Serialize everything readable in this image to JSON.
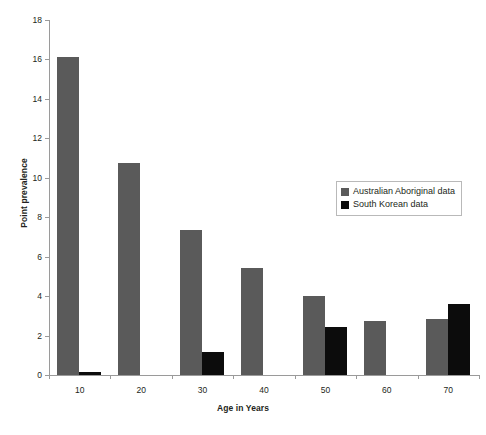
{
  "chart_data": {
    "type": "bar",
    "title": "",
    "xlabel": "Age in Years",
    "ylabel": "Point prevalence",
    "categories": [
      "10",
      "20",
      "30",
      "40",
      "50",
      "60",
      "70"
    ],
    "series": [
      {
        "name": "Australian Aboriginal data",
        "color": "#5a5a5a",
        "values": [
          16.1,
          10.75,
          7.35,
          5.45,
          4.0,
          2.75,
          2.85
        ]
      },
      {
        "name": "South Korean data",
        "color": "#0c0c0c",
        "values": [
          0.15,
          0,
          1.15,
          0,
          2.45,
          0,
          3.6
        ]
      }
    ],
    "ylim": [
      0,
      18
    ],
    "ytick_labels": [
      "0",
      "2",
      "4",
      "6",
      "8",
      "10",
      "12",
      "14",
      "16",
      "18"
    ],
    "ytick_values": [
      0,
      2,
      4,
      6,
      8,
      10,
      12,
      14,
      16,
      18
    ],
    "grid": false,
    "legend_position": "upper-right"
  }
}
